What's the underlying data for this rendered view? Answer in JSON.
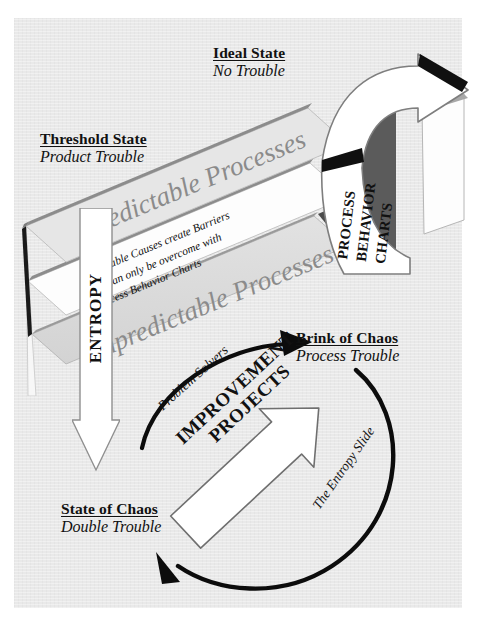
{
  "diagram": {
    "title": "The Entropy Slide",
    "type": "process-improvement-cycle",
    "paper_color": "#e9e9e9",
    "band_text_color": "#8b8b8b",
    "ink_color": "#111111"
  },
  "states": [
    {
      "id": "ideal",
      "heading": "Ideal State",
      "subtitle": "No Trouble"
    },
    {
      "id": "threshold",
      "heading": "Threshold State",
      "subtitle": "Product Trouble"
    },
    {
      "id": "brink",
      "heading": "Brink of Chaos",
      "subtitle": "Process Trouble"
    },
    {
      "id": "chaos",
      "heading": "State of Chaos",
      "subtitle": "Double Trouble"
    }
  ],
  "bands": {
    "upper": "Predictable Processes",
    "lower": "Unpredictable Processes",
    "middle_lines": [
      "Assignable Causes create Barriers",
      "that can only be overcome with",
      "Process Behavior Charts"
    ]
  },
  "arrows": {
    "entropy": "ENTROPY",
    "process_behavior_charts": [
      "PROCESS",
      "BEHAVIOR",
      "CHARTS"
    ],
    "improvement": {
      "line1": "IMPROVEMENT",
      "line2": "PROJECTS"
    }
  },
  "arcs": {
    "left": "Problem Solvers",
    "right": "The Entropy Slide"
  }
}
